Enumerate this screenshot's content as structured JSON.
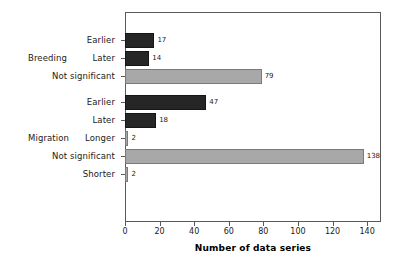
{
  "chart_data": {
    "type": "bar",
    "orientation": "horizontal",
    "title": "",
    "xlabel": "Number of data series",
    "ylabel": "",
    "xlim": [
      0,
      148
    ],
    "xticks": [
      0,
      20,
      40,
      60,
      80,
      100,
      120,
      140
    ],
    "grid": false,
    "legend": false,
    "groups": [
      {
        "name": "Breeding",
        "categories": [
          "Earlier",
          "Later",
          "Not significant"
        ],
        "values": [
          17,
          14,
          79
        ],
        "colors": [
          "#262626",
          "#262626",
          "#a8a8a8"
        ]
      },
      {
        "name": "Migration",
        "categories": [
          "Earlier",
          "Later",
          "Longer",
          "Not significant",
          "Shorter"
        ],
        "values": [
          47,
          18,
          2,
          138,
          2
        ],
        "colors": [
          "#262626",
          "#262626",
          "#a8a8a8",
          "#a8a8a8",
          "#a8a8a8"
        ]
      }
    ],
    "categories": [
      "Earlier",
      "Later",
      "Not significant",
      "Earlier",
      "Later",
      "Longer",
      "Not significant",
      "Shorter"
    ],
    "values": [
      17,
      14,
      79,
      47,
      18,
      2,
      138,
      2
    ],
    "data_labels": [
      "17",
      "14",
      "79",
      "47",
      "18",
      "2",
      "138",
      "2"
    ]
  },
  "axis": {
    "xtick_labels": [
      "0",
      "20",
      "40",
      "60",
      "80",
      "100",
      "120",
      "140"
    ],
    "title": "Number of data series"
  },
  "groups": {
    "breeding_label": "Breeding",
    "migration_label": "Migration"
  },
  "colors": {
    "dark_bar": "#262626",
    "light_bar": "#a8a8a8",
    "frame": "#5a5a5a",
    "text": "#1a1a1a",
    "background": "#ffffff"
  }
}
